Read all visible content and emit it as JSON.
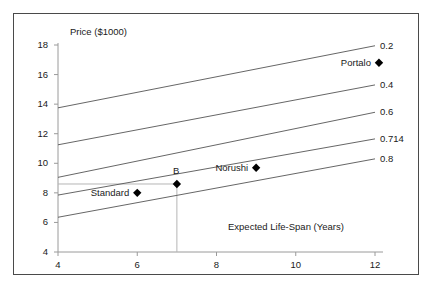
{
  "chart_data": {
    "type": "scatter",
    "title": "",
    "xlabel": "Expected Life-Span (Years)",
    "ylabel": "Price ($1000)",
    "xlim": [
      4,
      12
    ],
    "ylim": [
      4,
      18
    ],
    "grid": false,
    "legend_position": "right-inline-labels",
    "xticks": [
      "4",
      "6",
      "8",
      "10",
      "12"
    ],
    "xtick_values": [
      4,
      6,
      8,
      10,
      12
    ],
    "yticks": [
      "18",
      "16",
      "14",
      "12",
      "10",
      "8",
      "6",
      "4"
    ],
    "ytick_values": [
      18,
      16,
      14,
      12,
      10,
      8,
      6,
      4
    ],
    "series": [
      {
        "name": "0.2",
        "label": "0.2",
        "type": "line",
        "x": [
          4,
          12
        ],
        "y": [
          13.75,
          17.95
        ]
      },
      {
        "name": "0.4",
        "label": "0.4",
        "type": "line",
        "x": [
          4,
          12
        ],
        "y": [
          11.25,
          15.3
        ]
      },
      {
        "name": "0.6",
        "label": "0.6",
        "type": "line",
        "x": [
          4,
          12
        ],
        "y": [
          9.05,
          13.45
        ]
      },
      {
        "name": "0.714",
        "label": "0.714",
        "type": "line",
        "x": [
          4,
          12
        ],
        "y": [
          7.85,
          11.65
        ]
      },
      {
        "name": "0.8",
        "label": "0.8",
        "type": "line",
        "x": [
          4,
          12
        ],
        "y": [
          6.35,
          10.3
        ]
      }
    ],
    "points": [
      {
        "label": "Standard",
        "x": 6,
        "y": 8.0,
        "label_side": "left"
      },
      {
        "label": "B",
        "x": 7,
        "y": 8.6,
        "label_side": "top"
      },
      {
        "label": "Norushi",
        "x": 9,
        "y": 9.7,
        "label_side": "left"
      },
      {
        "label": "Portalo",
        "x": 12.1,
        "y": 16.8,
        "label_side": "left"
      }
    ],
    "guides": [
      {
        "name": "b-horizontal-guide",
        "from": {
          "x": 4,
          "y": 8.6
        },
        "to": {
          "x": 7,
          "y": 8.6
        }
      },
      {
        "name": "b-vertical-guide",
        "from": {
          "x": 7,
          "y": 4
        },
        "to": {
          "x": 7,
          "y": 8.6
        }
      }
    ],
    "colors": {
      "line": "#555555",
      "axis": "#9a9a9a",
      "marker": "#000000",
      "text": "#1a1a1a",
      "frame": "#4a4a4a",
      "guide": "#b5b5b5",
      "background": "#ffffff"
    }
  }
}
